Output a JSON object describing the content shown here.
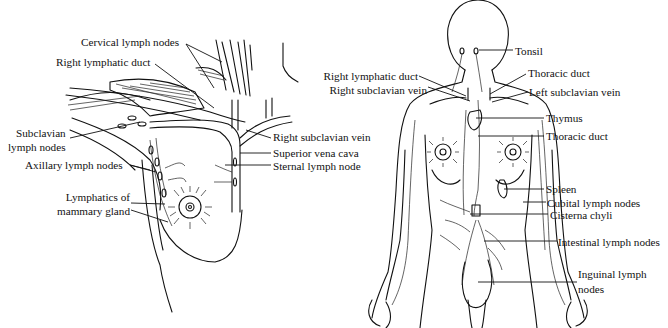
{
  "figure": {
    "left_panel": {
      "name": "Breast and axillary lymphatics",
      "labels": [
        {
          "id": "cervical",
          "text": "Cervical lymph nodes"
        },
        {
          "id": "right_lymphatic_duct",
          "text": "Right lymphatic duct"
        },
        {
          "id": "subclavian_1",
          "text": "Subclavian"
        },
        {
          "id": "subclavian_2",
          "text": "lymph nodes"
        },
        {
          "id": "axillary",
          "text": "Axillary lymph nodes"
        },
        {
          "id": "mammary_1",
          "text": "Lymphatics of"
        },
        {
          "id": "mammary_2",
          "text": "mammary gland"
        },
        {
          "id": "right_subclavian_vein",
          "text": "Right subclavian vein"
        },
        {
          "id": "svc",
          "text": "Superior vena cava"
        },
        {
          "id": "sternal",
          "text": "Sternal lymph node"
        }
      ]
    },
    "right_panel": {
      "name": "Whole-body lymphatic system",
      "labels": [
        {
          "id": "tonsil",
          "text": "Tonsil"
        },
        {
          "id": "right_lymphatic_duct",
          "text": "Right lymphatic duct"
        },
        {
          "id": "right_subclavian_vein",
          "text": "Right subclavian vein"
        },
        {
          "id": "thoracic_duct_top",
          "text": "Thoracic duct"
        },
        {
          "id": "left_subclavian_vein",
          "text": "Left subclavian vein"
        },
        {
          "id": "thymus",
          "text": "Thymus"
        },
        {
          "id": "thoracic_duct",
          "text": "Thoracic duct"
        },
        {
          "id": "spleen",
          "text": "Spleen"
        },
        {
          "id": "cubital",
          "text": "Cubital lymph nodes"
        },
        {
          "id": "cisterna",
          "text": "Cisterna chyli"
        },
        {
          "id": "intestinal",
          "text": "Intestinal lymph nodes"
        },
        {
          "id": "inguinal_1",
          "text": "Inguinal lymph"
        },
        {
          "id": "inguinal_2",
          "text": "nodes"
        }
      ]
    }
  }
}
